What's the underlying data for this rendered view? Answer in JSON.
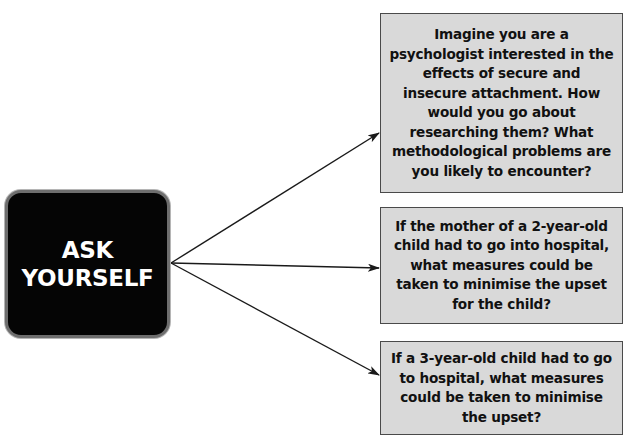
{
  "diagram": {
    "source_node": {
      "lines": [
        "ASK",
        "YOURSELF"
      ],
      "background_color": "#050505",
      "border_color": "#6e6e6e",
      "text_color": "#ffffff"
    },
    "questions": [
      {
        "text": "Imagine you are a psychologist interested in the effects of secure and insecure attachment. How would you go about researching them? What methodological problems are you likely to encounter?"
      },
      {
        "text": "If the mother of a 2-year-old child had to go into hospital, what measures could be taken to minimise the upset for the child?"
      },
      {
        "text": "If a 3-year-old child had to go to hospital, what measures could be taken to minimise the upset?"
      }
    ],
    "box_fill_color": "#d9d9d9",
    "box_border_color": "#4a4a4a",
    "arrow_color": "#1a1a1a"
  }
}
